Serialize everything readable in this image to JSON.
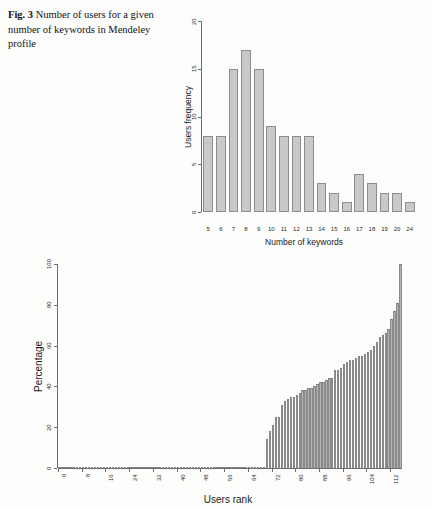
{
  "caption": {
    "label": "Fig. 3",
    "text": "Number of users for a given number of keywords in Mendeley profile"
  },
  "colors": {
    "bar_fill": "#c9c9c9",
    "bar_stroke": "#8d8d8d",
    "bar_fill_2": "#b5b5b5",
    "axis": "#6e6e6e",
    "text": "#1a1a1a",
    "page_background": "#fdfdfc"
  },
  "chart_data": [
    {
      "type": "bar",
      "id": "keyword-frequency-histogram",
      "title": "",
      "xlabel": "Number of keywords",
      "ylabel": "Users frequency",
      "categories": [
        "5",
        "6",
        "7",
        "8",
        "9",
        "10",
        "11",
        "12",
        "13",
        "14",
        "15",
        "16",
        "17",
        "18",
        "19",
        "20",
        "24"
      ],
      "values": [
        8,
        8,
        15,
        17,
        15,
        9,
        8,
        8,
        8,
        3,
        2,
        1,
        4,
        3,
        2,
        2,
        1
      ],
      "xlim": [
        0,
        17
      ],
      "ylim": [
        0,
        20
      ],
      "yticks": [
        0,
        5,
        10,
        15,
        20
      ],
      "ytick_labels": [
        "0",
        "5",
        "10",
        "15",
        "20"
      ],
      "xtick_labels": [
        "5",
        "6",
        "7",
        "8",
        "9",
        "10",
        "11",
        "12",
        "13",
        "14",
        "15",
        "16",
        "17",
        "18",
        "19",
        "20",
        "24"
      ],
      "grid": false,
      "legend": false
    },
    {
      "type": "bar",
      "id": "users-rank-percentage",
      "title": "",
      "xlabel": "Users rank",
      "ylabel": "Percentage",
      "ylim": [
        0,
        100
      ],
      "yticks": [
        0,
        20,
        40,
        60,
        80,
        100
      ],
      "ytick_labels": [
        "0",
        "20",
        "40",
        "60",
        "80",
        "100"
      ],
      "xticks": [
        0,
        8,
        16,
        24,
        32,
        40,
        48,
        56,
        64,
        72,
        80,
        88,
        96,
        104,
        112
      ],
      "xtick_labels": [
        "0",
        "8",
        "16",
        "24",
        "32",
        "40",
        "48",
        "56",
        "64",
        "72",
        "80",
        "88",
        "96",
        "104",
        "112"
      ],
      "xlim": [
        0,
        116
      ],
      "grid": false,
      "legend": false,
      "values": [
        0,
        0,
        0,
        0,
        0,
        0,
        0,
        0,
        0,
        0,
        0,
        0,
        0,
        0,
        0,
        0,
        0,
        0,
        0,
        0,
        0,
        0,
        0,
        0,
        0,
        0,
        0,
        0,
        0,
        0,
        0,
        0,
        0,
        0,
        0,
        0,
        0,
        0,
        0,
        0,
        0,
        0,
        0,
        0,
        0,
        0,
        0,
        0,
        0,
        0,
        0,
        0,
        0,
        0,
        0,
        0,
        0,
        0,
        0,
        0,
        0,
        0,
        0,
        0,
        0,
        0,
        0,
        0,
        0,
        0,
        14,
        18,
        21,
        25,
        25,
        31,
        33,
        34,
        35,
        35,
        36,
        37,
        38,
        38,
        39,
        39,
        40,
        41,
        42,
        42,
        43,
        44,
        44,
        48,
        48,
        49,
        51,
        52,
        53,
        53,
        54,
        55,
        55,
        56,
        57,
        58,
        60,
        62,
        64,
        65,
        66,
        68,
        73,
        77,
        81,
        100
      ]
    }
  ]
}
